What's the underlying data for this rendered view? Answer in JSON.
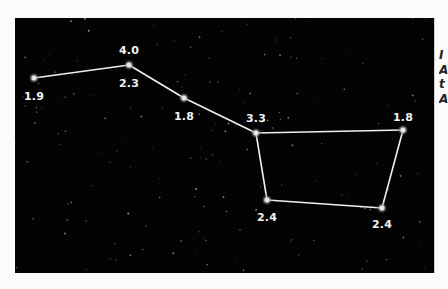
{
  "figure": {
    "background_color": "#030303",
    "line_color": "#f0f0f0",
    "label_color": "#f2f2f2",
    "stars": [
      {
        "id": "star-1",
        "x": 19,
        "y": 60,
        "labels": [
          {
            "text": "1.9",
            "pos": "below"
          }
        ]
      },
      {
        "id": "star-2",
        "x": 114,
        "y": 47,
        "labels": [
          {
            "text": "4.0",
            "pos": "above"
          },
          {
            "text": "2.3",
            "pos": "below"
          }
        ]
      },
      {
        "id": "star-3",
        "x": 169,
        "y": 80,
        "labels": [
          {
            "text": "1.8",
            "pos": "below"
          }
        ]
      },
      {
        "id": "star-4",
        "x": 241,
        "y": 115,
        "labels": [
          {
            "text": "3.3",
            "pos": "above"
          }
        ]
      },
      {
        "id": "star-5",
        "x": 388,
        "y": 112,
        "labels": [
          {
            "text": "1.8",
            "pos": "above"
          }
        ]
      },
      {
        "id": "star-6",
        "x": 252,
        "y": 182,
        "labels": [
          {
            "text": "2.4",
            "pos": "below"
          }
        ]
      },
      {
        "id": "star-7",
        "x": 367,
        "y": 190,
        "labels": [
          {
            "text": "2.4",
            "pos": "below"
          }
        ]
      }
    ],
    "connections": [
      [
        "star-1",
        "star-2"
      ],
      [
        "star-2",
        "star-3"
      ],
      [
        "star-3",
        "star-4"
      ],
      [
        "star-4",
        "star-5"
      ],
      [
        "star-4",
        "star-6"
      ],
      [
        "star-6",
        "star-7"
      ],
      [
        "star-7",
        "star-5"
      ]
    ],
    "labels": {
      "star1_below": "1.9",
      "star2_above": "4.0",
      "star2_below": "2.3",
      "star3_below": "1.8",
      "star4_above": "3.3",
      "star5_above": "1.8",
      "star6_below": "2.4",
      "star7_below": "2.4"
    }
  },
  "margin_text": {
    "fragments": [
      "I",
      "A",
      "t",
      "A"
    ]
  }
}
